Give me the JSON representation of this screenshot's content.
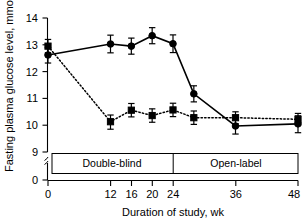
{
  "chart_data": {
    "type": "line",
    "title": "",
    "xlabel": "Duration of study, wk",
    "ylabel": "Fasting plasma glucose level, mmol/L",
    "x": [
      0,
      12,
      16,
      20,
      24,
      28,
      36,
      48
    ],
    "xticks": [
      0,
      12,
      16,
      20,
      24,
      36,
      48
    ],
    "xtick_labels": [
      "0",
      "12",
      "16",
      "20",
      "24",
      "36",
      "48"
    ],
    "yticks": [
      0,
      9,
      10,
      11,
      12,
      13,
      14
    ],
    "ytick_labels": [
      "0",
      "9",
      "10",
      "11",
      "12",
      "13",
      "14"
    ],
    "xlim": [
      0,
      48
    ],
    "ylim": [
      9,
      14
    ],
    "y_axis_break": true,
    "grid": false,
    "legend": "none",
    "series": [
      {
        "name": "circle-series",
        "marker": "circle",
        "linestyle": "solid",
        "x": [
          0,
          12,
          16,
          20,
          24,
          28,
          36,
          48
        ],
        "values": [
          12.62,
          13.03,
          12.95,
          13.34,
          13.04,
          11.17,
          9.97,
          10.05
        ],
        "err_low": [
          0.3,
          0.33,
          0.3,
          0.3,
          0.33,
          0.3,
          0.3,
          0.33
        ],
        "err_high": [
          0.28,
          0.33,
          0.3,
          0.3,
          0.33,
          0.3,
          0.28,
          0.3
        ]
      },
      {
        "name": "square-series",
        "marker": "square",
        "linestyle": "dotted",
        "x": [
          0,
          12,
          16,
          20,
          24,
          28,
          36,
          48
        ],
        "values": [
          12.95,
          10.13,
          10.56,
          10.36,
          10.57,
          10.28,
          10.28,
          10.22
        ],
        "err_low": [
          0.25,
          0.28,
          0.25,
          0.25,
          0.25,
          0.25,
          0.22,
          0.22
        ],
        "err_high": [
          0.25,
          0.25,
          0.25,
          0.25,
          0.25,
          0.25,
          0.22,
          0.22
        ]
      }
    ],
    "annotations": [
      {
        "name": "double-blind",
        "label": "Double-blind",
        "x_start": 0,
        "x_end": 24
      },
      {
        "name": "open-label",
        "label": "Open-label",
        "x_start": 24,
        "x_end": 48
      }
    ],
    "colors": {
      "ink": "#000000",
      "background": "#ffffff"
    }
  }
}
